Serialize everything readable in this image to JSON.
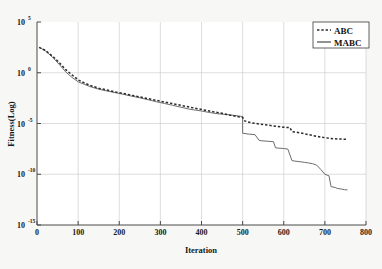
{
  "chart_data": {
    "type": "line",
    "title": "",
    "xlabel": "Iteration",
    "ylabel": "Fitness(Log)",
    "xlim": [
      0,
      800
    ],
    "ylim": [
      1e-15,
      100000.0
    ],
    "yscale": "log",
    "grid": true,
    "legend_position": "top-right",
    "xticks": [
      0,
      100,
      200,
      300,
      400,
      500,
      600,
      700,
      800
    ],
    "xtick_labels": [
      "0",
      "100",
      "200",
      "300",
      "400",
      "500",
      "600",
      "700",
      "800"
    ],
    "yticks": [
      100000.0,
      1.0,
      1e-05,
      1e-10,
      1e-15
    ],
    "ytick_labels": [
      "10^5",
      "10^0",
      "10^-5",
      "10^-10",
      "10^-15"
    ],
    "ytick_mantissa": [
      "10",
      "10",
      "10",
      "10",
      "10"
    ],
    "ytick_exponents": [
      "5",
      "0",
      "-5",
      "-10",
      "-15"
    ],
    "series": [
      {
        "name": "ABC",
        "style": "dashed",
        "color": "#2b2b2b",
        "x": [
          5,
          20,
          40,
          55,
          70,
          85,
          100,
          115,
          130,
          150,
          170,
          190,
          210,
          230,
          250,
          270,
          290,
          310,
          330,
          350,
          370,
          390,
          410,
          430,
          450,
          470,
          490,
          500,
          505,
          520,
          540,
          560,
          580,
          600,
          615,
          620,
          640,
          660,
          680,
          700,
          720,
          740,
          755
        ],
        "y": [
          320.0,
          160.0,
          36.0,
          9.0,
          2.0,
          0.62,
          0.2,
          0.1,
          0.055,
          0.03,
          0.02,
          0.013,
          0.009,
          0.006,
          0.0042,
          0.0028,
          0.0019,
          0.0013,
          0.0009,
          0.00062,
          0.00042,
          0.00029,
          0.0002,
          0.00014,
          0.0001,
          6.6e-05,
          4.6e-05,
          4e-05,
          1.8e-05,
          1.2e-05,
          9e-06,
          7e-06,
          5.5e-06,
          4.3e-06,
          3.9e-06,
          1.6e-06,
          1.2e-06,
          8e-07,
          5.5e-07,
          4e-07,
          3.2e-07,
          2.9e-07,
          2.8e-07
        ]
      },
      {
        "name": "MABC",
        "style": "solid",
        "color": "#6d6d6d",
        "x": [
          5,
          20,
          40,
          55,
          70,
          85,
          100,
          115,
          130,
          150,
          170,
          190,
          210,
          230,
          250,
          270,
          290,
          310,
          330,
          350,
          370,
          385,
          400,
          420,
          440,
          455,
          470,
          490,
          498,
          500,
          500,
          515,
          530,
          540,
          545,
          560,
          575,
          580,
          600,
          610,
          620,
          630,
          640,
          650,
          660,
          670,
          680,
          690,
          700,
          710,
          715,
          725,
          730,
          740,
          748,
          755
        ],
        "y": [
          320.0,
          150.0,
          28.0,
          6.0,
          1.2,
          0.35,
          0.13,
          0.072,
          0.042,
          0.024,
          0.016,
          0.011,
          0.0075,
          0.005,
          0.0034,
          0.0022,
          0.0014,
          0.00094,
          0.00062,
          0.0004,
          0.00026,
          0.00021,
          0.00017,
          0.00012,
          9e-05,
          8e-05,
          7e-05,
          5.5e-05,
          5e-05,
          5e-05,
          1.1e-06,
          9e-07,
          8e-07,
          2.2e-07,
          2e-07,
          1.8e-07,
          1.6e-07,
          4e-08,
          3.4e-08,
          3e-08,
          2.2e-09,
          1.9e-09,
          1.7e-09,
          1.5e-09,
          1.3e-09,
          1.1e-09,
          8e-10,
          3e-10,
          1e-10,
          7e-11,
          6e-12,
          5e-12,
          4e-12,
          3.5e-12,
          3e-12,
          2.9e-12
        ]
      }
    ]
  },
  "legend": {
    "items": [
      {
        "label": "ABC",
        "style": "dashed"
      },
      {
        "label": "MABC",
        "style": "solid"
      }
    ]
  }
}
